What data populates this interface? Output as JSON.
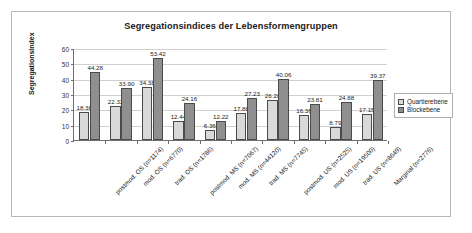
{
  "chart_data": {
    "type": "bar",
    "title": "Segregationsindices der Lebensformengruppen",
    "xlabel": "",
    "ylabel": "Segregationsindex",
    "ylim": [
      0,
      60
    ],
    "ytick_labels": [
      "60",
      "50",
      "40",
      "30",
      "20",
      "10",
      "0"
    ],
    "ytick_values": [
      60,
      50,
      40,
      30,
      20,
      10,
      0
    ],
    "grid": true,
    "legend_position": "right",
    "categories": [
      "postmod. OS (n=1174)",
      "mod. OS (n=6770)",
      "trad. OS (n=1786)",
      "postmod. MS (n=7067)",
      "mod. MS (n=44120)",
      "trad. MS (n=7745)",
      "postmod. US (n=2525)",
      "mod. US (n=19500)",
      "trad. US (n=8649)",
      "Marginal (n=2776)"
    ],
    "series": [
      {
        "name": "Quartierebene",
        "color": "#d9d9d9",
        "values": [
          18.38,
          22.32,
          34.38,
          12.44,
          6.36,
          17.88,
          26.28,
          16.36,
          8.79,
          17.15
        ]
      },
      {
        "name": "Blockebene",
        "color": "#8f8f8f",
        "values": [
          44.28,
          33.9,
          53.42,
          24.16,
          12.22,
          27.23,
          40.06,
          23.81,
          24.88,
          39.37
        ]
      }
    ],
    "data_labels": [
      [
        "18.38",
        "22.32",
        "34.38",
        "12.44",
        "6.36",
        "17.88",
        "26.28",
        "16.36",
        "8.79",
        "17.15"
      ],
      [
        "44.28",
        "33.90",
        "53.42",
        "24.16",
        "12.22",
        "27.23",
        "40.06",
        "23.81",
        "24.88",
        "39.37"
      ]
    ]
  }
}
